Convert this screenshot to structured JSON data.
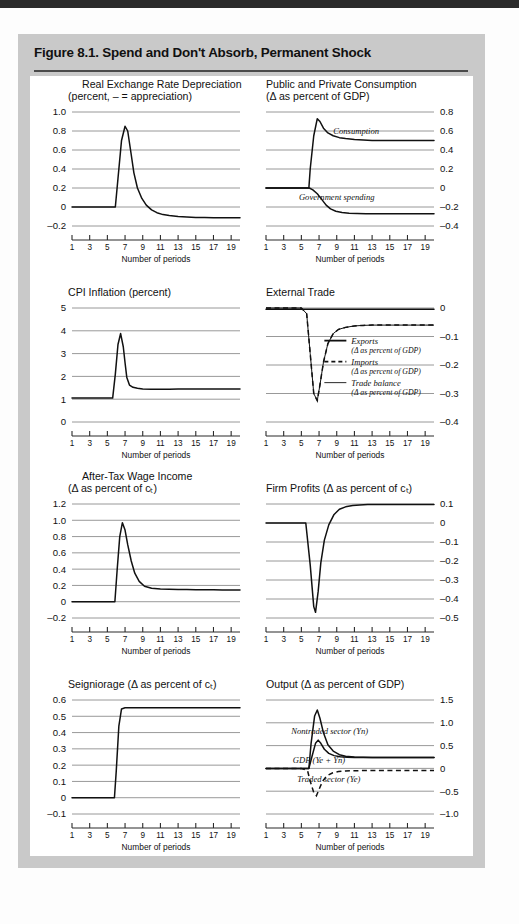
{
  "figure": {
    "title": "Figure 8.1. Spend and Don't Absorb, Permanent Shock",
    "x_axis_title": "Number of periods",
    "x_ticks": [
      "1",
      "3",
      "5",
      "7",
      "9",
      "11",
      "13",
      "15",
      "17",
      "19"
    ]
  },
  "chart_data": [
    {
      "id": "real-exchange-rate-depreciation",
      "type": "line",
      "title": "Real Exchange Rate Depreciation",
      "subtitle": "(percent, – = appreciation)",
      "axis_side": "left",
      "xlabel": "Number of periods",
      "ylabel": "",
      "ylim": [
        -0.2,
        1.0
      ],
      "yticks": [
        1.0,
        0.8,
        0.6,
        0.4,
        0.2,
        0,
        -0.2
      ],
      "ytick_labels": [
        "1.0",
        "0.8",
        "0.6",
        "0.4",
        "0.2",
        "0",
        "–0.2"
      ],
      "xlim": [
        1,
        20
      ],
      "xticks": [
        1,
        3,
        5,
        7,
        9,
        11,
        13,
        15,
        17,
        19
      ],
      "grid": true,
      "series": [
        {
          "name": "Real exchange rate depreciation",
          "style": "solid",
          "x": [
            1,
            2,
            3,
            4,
            5,
            5.9,
            6.2,
            6.6,
            7.0,
            7.3,
            7.7,
            8.0,
            8.4,
            8.9,
            9.4,
            10,
            10.6,
            11.3,
            12,
            13,
            14,
            15,
            16,
            17,
            18,
            19,
            20
          ],
          "values": [
            0,
            0,
            0,
            0,
            0,
            0,
            0.3,
            0.7,
            0.85,
            0.8,
            0.55,
            0.36,
            0.2,
            0.09,
            0.02,
            -0.03,
            -0.06,
            -0.08,
            -0.09,
            -0.1,
            -0.105,
            -0.11,
            -0.11,
            -0.112,
            -0.112,
            -0.112,
            -0.112
          ]
        }
      ]
    },
    {
      "id": "public-and-private-consumption",
      "type": "line",
      "title": "Public and Private Consumption",
      "subtitle": "(Δ as percent of GDP)",
      "axis_side": "right",
      "xlabel": "Number of periods",
      "ylim": [
        -0.4,
        0.8
      ],
      "yticks": [
        0.8,
        0.6,
        0.4,
        0.2,
        0,
        -0.2,
        -0.4
      ],
      "ytick_labels": [
        "0.8",
        "0.6",
        "0.4",
        "0.2",
        "0",
        "–0.2",
        "–0.4"
      ],
      "xlim": [
        1,
        20
      ],
      "xticks": [
        1,
        3,
        5,
        7,
        9,
        11,
        13,
        15,
        17,
        19
      ],
      "grid": true,
      "annotations": [
        {
          "text": "Consumption",
          "x": 11.2,
          "y": 0.57
        },
        {
          "text": "Government spending",
          "x": 9.0,
          "y": -0.13
        }
      ],
      "series": [
        {
          "name": "Consumption",
          "style": "solid",
          "x": [
            1,
            2,
            3,
            4,
            5,
            5.85,
            6.0,
            6.4,
            6.8,
            7.1,
            7.5,
            8,
            8.6,
            9.3,
            10,
            11,
            12,
            13,
            14,
            15,
            16,
            17,
            18,
            19,
            20
          ],
          "values": [
            0,
            0,
            0,
            0,
            0,
            0,
            0.2,
            0.55,
            0.73,
            0.7,
            0.63,
            0.58,
            0.55,
            0.53,
            0.52,
            0.51,
            0.505,
            0.5,
            0.5,
            0.5,
            0.5,
            0.5,
            0.5,
            0.5,
            0.5
          ]
        },
        {
          "name": "Government spending",
          "style": "solid",
          "x": [
            1,
            2,
            3,
            4,
            5,
            5.9,
            6.3,
            6.8,
            7.3,
            7.8,
            8.3,
            8.9,
            9.6,
            10.4,
            11.3,
            12.3,
            13.5,
            15,
            16.5,
            18,
            19,
            20
          ],
          "values": [
            0,
            0,
            0,
            0,
            0,
            0,
            -0.02,
            -0.06,
            -0.12,
            -0.18,
            -0.22,
            -0.245,
            -0.258,
            -0.265,
            -0.268,
            -0.27,
            -0.27,
            -0.27,
            -0.27,
            -0.27,
            -0.27,
            -0.27
          ]
        }
      ]
    },
    {
      "id": "cpi-inflation",
      "type": "line",
      "title": "CPI Inflation (percent)",
      "subtitle": "",
      "axis_side": "left",
      "xlabel": "Number of periods",
      "ylim": [
        0,
        5
      ],
      "yticks": [
        5,
        4,
        3,
        2,
        1,
        0
      ],
      "ytick_labels": [
        "5",
        "4",
        "3",
        "2",
        "1",
        "0"
      ],
      "xlim": [
        1,
        20
      ],
      "xticks": [
        1,
        3,
        5,
        7,
        9,
        11,
        13,
        15,
        17,
        19
      ],
      "grid": true,
      "series": [
        {
          "name": "CPI inflation",
          "style": "solid",
          "x": [
            1,
            2,
            3,
            4,
            5,
            5.6,
            5.9,
            6.2,
            6.5,
            6.8,
            7.0,
            7.2,
            7.5,
            7.9,
            8.4,
            9,
            10,
            11,
            12,
            13,
            14,
            15,
            16,
            17,
            18,
            19,
            20
          ],
          "values": [
            1.05,
            1.05,
            1.05,
            1.05,
            1.05,
            1.05,
            2.1,
            3.4,
            3.88,
            3.3,
            2.6,
            1.95,
            1.62,
            1.52,
            1.48,
            1.45,
            1.44,
            1.44,
            1.44,
            1.45,
            1.45,
            1.45,
            1.45,
            1.45,
            1.45,
            1.45,
            1.45
          ]
        }
      ]
    },
    {
      "id": "external-trade",
      "type": "line",
      "title": "External Trade",
      "subtitle": "",
      "axis_side": "right",
      "xlabel": "Number of periods",
      "ylim": [
        -0.4,
        0
      ],
      "yticks": [
        0,
        -0.1,
        -0.2,
        -0.3,
        -0.4
      ],
      "ytick_labels": [
        "0",
        "–0.1",
        "–0.2",
        "–0.3",
        "–0.4"
      ],
      "xlim": [
        1,
        20
      ],
      "xticks": [
        1,
        3,
        5,
        7,
        9,
        11,
        13,
        15,
        17,
        19
      ],
      "grid": true,
      "legend_position": "center-right",
      "legend": [
        {
          "label": "Exports",
          "sublabel": "(Δ as percent of GDP)",
          "style": "solid-thick"
        },
        {
          "label": "Imports",
          "sublabel": "(Δ as percent of GDP)",
          "style": "dashed"
        },
        {
          "label": "Trade balance",
          "sublabel": "(Δ as percent of GDP)",
          "style": "solid-thin"
        }
      ],
      "series": [
        {
          "name": "Exports",
          "style": "solid",
          "x": [
            1,
            3,
            5,
            6,
            8,
            10,
            12,
            14,
            16,
            18,
            20
          ],
          "values": [
            -0.004,
            -0.004,
            -0.004,
            -0.004,
            -0.004,
            -0.004,
            -0.004,
            -0.004,
            -0.004,
            -0.004,
            -0.004
          ]
        },
        {
          "name": "Imports",
          "style": "dashed",
          "x": [
            1,
            2,
            3,
            4,
            5,
            5.6,
            6.0,
            6.4,
            6.8,
            7.1,
            7.5,
            8,
            8.6,
            9.2,
            10,
            11,
            12,
            13,
            14,
            15,
            16,
            17,
            18,
            19,
            20
          ],
          "values": [
            0,
            0,
            0,
            0,
            0,
            -0.02,
            -0.16,
            -0.3,
            -0.325,
            -0.27,
            -0.19,
            -0.125,
            -0.09,
            -0.075,
            -0.068,
            -0.063,
            -0.061,
            -0.06,
            -0.06,
            -0.06,
            -0.06,
            -0.06,
            -0.06,
            -0.06,
            -0.06
          ]
        },
        {
          "name": "Trade balance",
          "style": "solid",
          "x": [
            1,
            2,
            3,
            4,
            5,
            5.6,
            6.0,
            6.4,
            6.8,
            7.1,
            7.5,
            8,
            8.6,
            9.2,
            10,
            11,
            12,
            13,
            14,
            15,
            16,
            17,
            18,
            19,
            20
          ],
          "values": [
            0,
            0,
            0,
            0,
            0,
            -0.02,
            -0.16,
            -0.3,
            -0.325,
            -0.27,
            -0.19,
            -0.125,
            -0.09,
            -0.075,
            -0.068,
            -0.063,
            -0.061,
            -0.06,
            -0.06,
            -0.06,
            -0.06,
            -0.06,
            -0.06,
            -0.06,
            -0.06
          ]
        }
      ]
    },
    {
      "id": "after-tax-wage-income",
      "type": "line",
      "title": "After-Tax Wage Income",
      "subtitle": "(Δ as percent of cₜ)",
      "axis_side": "left",
      "xlabel": "Number of periods",
      "ylim": [
        -0.2,
        1.2
      ],
      "yticks": [
        1.2,
        1.0,
        0.8,
        0.6,
        0.4,
        0.2,
        0,
        -0.2
      ],
      "ytick_labels": [
        "1.2",
        "1.0",
        "0.8",
        "0.6",
        "0.4",
        "0.2",
        "0",
        "–0.2"
      ],
      "xlim": [
        1,
        20
      ],
      "xticks": [
        1,
        3,
        5,
        7,
        9,
        11,
        13,
        15,
        17,
        19
      ],
      "grid": true,
      "series": [
        {
          "name": "After-tax wage income",
          "style": "solid",
          "x": [
            1,
            2,
            3,
            4,
            5,
            5.85,
            6.1,
            6.4,
            6.7,
            7.0,
            7.3,
            7.7,
            8.1,
            8.6,
            9.2,
            10,
            11,
            12,
            13,
            14,
            15,
            16,
            17,
            18,
            19,
            20
          ],
          "values": [
            0,
            0,
            0,
            0,
            0,
            0,
            0.38,
            0.8,
            0.97,
            0.88,
            0.7,
            0.5,
            0.35,
            0.25,
            0.19,
            0.165,
            0.155,
            0.152,
            0.15,
            0.15,
            0.148,
            0.147,
            0.146,
            0.145,
            0.145,
            0.145
          ]
        }
      ]
    },
    {
      "id": "firm-profits",
      "type": "line",
      "title": "Firm Profits (Δ as percent of cₜ)",
      "subtitle": "",
      "axis_side": "right",
      "xlabel": "Number of periods",
      "ylim": [
        -0.5,
        0.1
      ],
      "yticks": [
        0.1,
        0,
        -0.1,
        -0.2,
        -0.3,
        -0.4,
        -0.5
      ],
      "ytick_labels": [
        "0.1",
        "0",
        "–0.1",
        "–0.2",
        "–0.3",
        "–0.4",
        "–0.5"
      ],
      "xlim": [
        1,
        20
      ],
      "xticks": [
        1,
        3,
        5,
        7,
        9,
        11,
        13,
        15,
        17,
        19
      ],
      "grid": true,
      "series": [
        {
          "name": "Firm profits",
          "style": "solid",
          "x": [
            1,
            2,
            3,
            4,
            5,
            5.5,
            6.0,
            6.4,
            6.6,
            6.9,
            7.2,
            7.6,
            8.1,
            8.7,
            9.3,
            10,
            10.8,
            11.6,
            12.5,
            13.5,
            15,
            16.5,
            18,
            19,
            20
          ],
          "values": [
            0,
            0,
            0,
            0,
            0,
            0,
            -0.22,
            -0.44,
            -0.47,
            -0.36,
            -0.21,
            -0.09,
            -0.01,
            0.045,
            0.072,
            0.085,
            0.092,
            0.095,
            0.097,
            0.098,
            0.098,
            0.098,
            0.098,
            0.098,
            0.098
          ]
        }
      ]
    },
    {
      "id": "seigniorage",
      "type": "line",
      "title": "Seigniorage (Δ as percent of cₜ)",
      "subtitle": "",
      "axis_side": "left",
      "xlim": [
        1,
        20
      ],
      "xlabel": "Number of periods",
      "ylim": [
        -0.1,
        0.6
      ],
      "yticks": [
        0.6,
        0.5,
        0.4,
        0.3,
        0.2,
        0.1,
        0,
        -0.1
      ],
      "ytick_labels": [
        "0.6",
        "0.5",
        "0.4",
        "0.3",
        "0.2",
        "0.1",
        "0",
        "–0.1"
      ],
      "xticks": [
        1,
        3,
        5,
        7,
        9,
        11,
        13,
        15,
        17,
        19
      ],
      "grid": true,
      "series": [
        {
          "name": "Seigniorage",
          "style": "solid",
          "x": [
            1,
            2,
            3,
            4,
            5,
            5.8,
            6.0,
            6.3,
            6.6,
            7,
            8,
            10,
            12,
            14,
            16,
            18,
            19.5,
            20
          ],
          "values": [
            0,
            0,
            0,
            0,
            0,
            0,
            0.16,
            0.44,
            0.545,
            0.552,
            0.553,
            0.553,
            0.553,
            0.553,
            0.553,
            0.553,
            0.553,
            0.553
          ]
        }
      ]
    },
    {
      "id": "output",
      "type": "line",
      "title": "Output (Δ as percent of GDP)",
      "subtitle": "",
      "axis_side": "right",
      "xlabel": "Number of periods",
      "ylim": [
        -1.0,
        1.5
      ],
      "yticks": [
        1.5,
        1.0,
        0.5,
        0,
        -0.5,
        -1.0
      ],
      "ytick_labels": [
        "1.5",
        "1.0",
        "0.5",
        "0",
        "–0.5",
        "–1.0"
      ],
      "xlim": [
        1,
        20
      ],
      "xticks": [
        1,
        3,
        5,
        7,
        9,
        11,
        13,
        15,
        17,
        19
      ],
      "grid": true,
      "annotations": [
        {
          "text": "Nontraded sector (Yn)",
          "x": 8.2,
          "y": 0.76
        },
        {
          "text": "GDP (Ye + Yn)",
          "x": 7.0,
          "y": 0.12
        },
        {
          "text": "Traded sector (Ye)",
          "x": 8.1,
          "y": -0.3
        }
      ],
      "series": [
        {
          "name": "Nontraded sector (Yn)",
          "style": "solid",
          "x": [
            1,
            2,
            3,
            4,
            5,
            5.85,
            6.1,
            6.5,
            6.8,
            7.1,
            7.5,
            8,
            8.6,
            9.3,
            10,
            11,
            12,
            13,
            14,
            15,
            16,
            17,
            18,
            19,
            20
          ],
          "values": [
            0,
            0,
            0,
            0,
            0,
            0,
            0.55,
            1.15,
            1.28,
            1.1,
            0.78,
            0.52,
            0.38,
            0.3,
            0.265,
            0.25,
            0.245,
            0.24,
            0.24,
            0.24,
            0.24,
            0.24,
            0.24,
            0.24,
            0.24
          ]
        },
        {
          "name": "GDP (Ye + Yn)",
          "style": "solid",
          "x": [
            1,
            2,
            3,
            4,
            5,
            5.85,
            6.2,
            6.6,
            6.9,
            7.2,
            7.6,
            8.1,
            8.7,
            9.4,
            10.2,
            11,
            12,
            13,
            14,
            15,
            16,
            17,
            18,
            19,
            20
          ],
          "values": [
            0,
            0,
            0,
            0,
            0,
            0,
            0.26,
            0.55,
            0.62,
            0.55,
            0.42,
            0.33,
            0.28,
            0.255,
            0.245,
            0.24,
            0.238,
            0.237,
            0.237,
            0.237,
            0.237,
            0.237,
            0.237,
            0.237,
            0.237
          ]
        },
        {
          "name": "Traded sector (Ye)",
          "style": "dashed",
          "x": [
            1,
            2,
            3,
            4,
            5,
            5.7,
            6.0,
            6.4,
            6.7,
            7.0,
            7.4,
            7.9,
            8.5,
            9.2,
            10,
            11,
            12,
            13,
            14,
            15,
            16,
            17,
            18,
            19,
            20
          ],
          "values": [
            0,
            0,
            0,
            0,
            0,
            -0.05,
            -0.28,
            -0.53,
            -0.6,
            -0.46,
            -0.28,
            -0.16,
            -0.1,
            -0.07,
            -0.055,
            -0.05,
            -0.048,
            -0.047,
            -0.046,
            -0.046,
            -0.046,
            -0.046,
            -0.046,
            -0.046,
            -0.046
          ]
        }
      ]
    }
  ]
}
